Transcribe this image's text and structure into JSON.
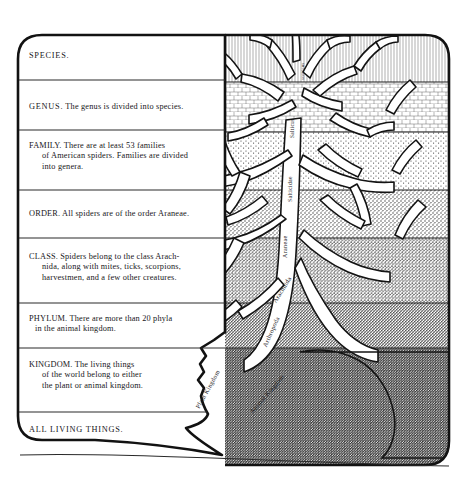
{
  "figure": {
    "kind": "taxonomy-tree-illustration",
    "ink_color": "#17161a",
    "paper_color": "#ffffff"
  },
  "left_panel": {
    "name": "taxonomy-ladder",
    "rows": [
      {
        "rank": "SPECIES.",
        "body": ""
      },
      {
        "rank": "GENUS.",
        "body": "The genus is divided into species."
      },
      {
        "rank": "FAMILY.",
        "body": "There are at least 53 families of American spiders. Families are divided into genera.",
        "lines": [
          "FAMILY.  There are at least 53 families",
          "of American spiders. Families are divided",
          "into genera."
        ]
      },
      {
        "rank": "ORDER.",
        "body": "All spiders are of the order Araneae.",
        "lines": [
          "ORDER.  All spiders are of the order Araneae."
        ]
      },
      {
        "rank": "CLASS.",
        "body": "Spiders belong to the class Arachnida, along with mites, ticks, scorpions, harvestmen, and a few other creatures.",
        "lines": [
          "CLASS.  Spiders belong to the class Arach-",
          "nida, along with mites, ticks, scorpions,",
          "harvestmen, and a few other creatures."
        ]
      },
      {
        "rank": "PHYLUM.",
        "body": "There are more than 20 phyla in the animal kingdom.",
        "lines": [
          "PHYLUM.  There are more than 20 phyla",
          "in the animal kingdom."
        ]
      },
      {
        "rank": "KINGDOM.",
        "body": "The living things of the world belong to either the plant or animal kingdom.",
        "lines": [
          "KINGDOM.  The living things",
          "of the world belong to either",
          "the plant or animal kingdom."
        ]
      },
      {
        "rank": "ALL LIVING THINGS.",
        "body": "",
        "lines": [
          "ALL LIVING THINGS."
        ]
      }
    ],
    "row_line_1": [
      "SPECIES."
    ],
    "row_line_2": [
      "GENUS. The genus is divided into species."
    ]
  },
  "tree_panel": {
    "name": "tree-of-life-diagram",
    "trunk_labels": [
      {
        "id": "species-label",
        "text": "scenicus"
      },
      {
        "id": "genus-label",
        "text": "Salticus"
      },
      {
        "id": "family-label",
        "text": "Salticidae"
      },
      {
        "id": "order-label",
        "text": "Araneae"
      },
      {
        "id": "class-label",
        "text": "Arachnida"
      },
      {
        "id": "phylum-label",
        "text": "Arthropoda"
      },
      {
        "id": "animal-kingdom-label",
        "text": "Animal Kingdom"
      }
    ],
    "ground_labels": [
      {
        "id": "plant-kingdom-label",
        "text": "Plant Kingdom"
      }
    ],
    "bands": [
      {
        "rank": "SPECIES",
        "texture": "fine-vertical-hatch",
        "density": 1
      },
      {
        "rank": "GENUS",
        "texture": "brick-stipple",
        "density": 2
      },
      {
        "rank": "FAMILY",
        "texture": "coarse-stipple",
        "density": 3
      },
      {
        "rank": "ORDER",
        "texture": "coarse-stipple",
        "density": 4
      },
      {
        "rank": "CLASS",
        "texture": "dense-stipple",
        "density": 5
      },
      {
        "rank": "PHYLUM",
        "texture": "dense-stipple",
        "density": 6
      },
      {
        "rank": "KINGDOM",
        "texture": "very-dense-stipple",
        "density": 7
      }
    ]
  }
}
